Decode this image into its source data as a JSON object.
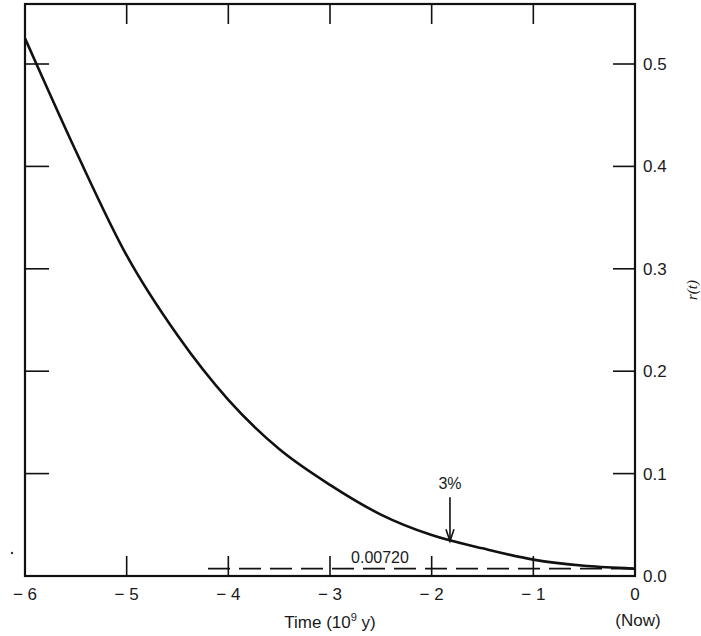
{
  "chart_data": {
    "type": "line",
    "title": "",
    "xlabel": "Time (10^9 y)",
    "xlabel_main": "Time (10",
    "xlabel_sup": "9",
    "xlabel_end": " y)",
    "ylabel": "r(t)",
    "xlim": [
      -6,
      0
    ],
    "ylim": [
      0.0,
      0.56
    ],
    "x_ticks": [
      "-6",
      "-5",
      "-4",
      "-3",
      "-2",
      "-1",
      "0"
    ],
    "x_now_label": "(Now)",
    "y_ticks": [
      "0.0",
      "0.1",
      "0.2",
      "0.3",
      "0.4",
      "0.5"
    ],
    "grid": false,
    "series": [
      {
        "name": "r(t)",
        "style": "solid",
        "x": [
          -6,
          -5.5,
          -5,
          -4.5,
          -4,
          -3.5,
          -3,
          -2.5,
          -2,
          -1.5,
          -1,
          -0.5,
          0
        ],
        "values": [
          0.525,
          0.415,
          0.313,
          0.235,
          0.172,
          0.124,
          0.089,
          0.06,
          0.04,
          0.027,
          0.016,
          0.01,
          0.0072
        ]
      },
      {
        "name": "0.00720 reference",
        "style": "dashed",
        "x": [
          -4.2,
          0
        ],
        "values": [
          0.0072,
          0.0072
        ]
      }
    ],
    "annotations": [
      {
        "text": "3%",
        "x": -1.82,
        "y": 0.03,
        "arrow": "down"
      },
      {
        "text": "0.00720",
        "x": -3.0,
        "y": 0.0072
      }
    ]
  }
}
